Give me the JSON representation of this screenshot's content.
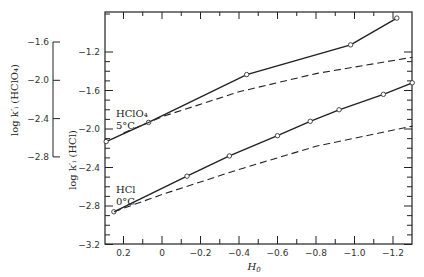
{
  "chart_data": {
    "type": "line",
    "title": "",
    "xlabel": "H0",
    "xlim": [
      0.3,
      -1.3
    ],
    "x_ticks": [
      0.2,
      0,
      -0.2,
      -0.4,
      -0.6,
      -0.8,
      -1.0,
      -1.2
    ],
    "x_tick_labels": [
      "0.2",
      "0",
      "−0.2",
      "−0.4",
      "−0.6",
      "−0.8",
      "−1.0",
      "−1.2"
    ],
    "y_axes": [
      {
        "id": "hcl",
        "label": "log k′ᵢ (HCl)",
        "position": "inner-left",
        "ylim": [
          -3.2,
          -0.8
        ],
        "ticks": [
          -1.2,
          -1.6,
          -2.0,
          -2.4,
          -2.8,
          -3.2
        ],
        "tick_labels": [
          "−1.2",
          "−1.6",
          "−2.0",
          "−2.4",
          "−2.8",
          "−3.2"
        ]
      },
      {
        "id": "hclo4",
        "label": "log k′ᵢ (HClO₄)",
        "position": "outer-left",
        "range": [
          -2.8,
          -1.6
        ],
        "ticks": [
          -1.6,
          -2.0,
          -2.4,
          -2.8
        ],
        "tick_labels": [
          "−1.6",
          "−2.0",
          "−2.4",
          "−2.8"
        ]
      }
    ],
    "series": [
      {
        "name": "HClO4 5°C (measured)",
        "axis": "hclo4",
        "style": "solid-with-open-circles",
        "x": [
          0.29,
          0.07,
          -0.44,
          -0.98,
          -1.22
        ],
        "y": [
          -2.64,
          -2.44,
          -1.94,
          -1.63,
          -1.35
        ],
        "note": "approximate; y read from outer-left HClO4 scale"
      },
      {
        "name": "HClO4 5°C (calculated)",
        "axis": "hclo4",
        "style": "dashed",
        "x": [
          0.2,
          0.0,
          -0.4,
          -0.8,
          -1.3
        ],
        "y": [
          -2.55,
          -2.38,
          -2.12,
          -1.93,
          -1.76
        ],
        "note": "approximate curve"
      },
      {
        "name": "HCl 0°C (measured)",
        "axis": "hcl",
        "style": "solid-with-open-circles",
        "x": [
          0.25,
          -0.13,
          -0.35,
          -0.6,
          -0.77,
          -0.92,
          -1.15,
          -1.3
        ],
        "y": [
          -2.86,
          -2.49,
          -2.28,
          -2.07,
          -1.92,
          -1.8,
          -1.64,
          -1.52
        ],
        "note": "approximate; y read from inner-left HCl scale"
      },
      {
        "name": "HCl 0°C (calculated)",
        "axis": "hcl",
        "style": "dashed",
        "x": [
          0.25,
          0.0,
          -0.4,
          -0.8,
          -1.3
        ],
        "y": [
          -2.86,
          -2.68,
          -2.42,
          -2.18,
          -1.97
        ],
        "note": "approximate curve"
      }
    ],
    "annotations": [
      {
        "text": "HClO₄",
        "sub": "5°C",
        "series": "HClO4"
      },
      {
        "text": "HCl",
        "sub": "0°C",
        "series": "HCl"
      }
    ],
    "grid": false,
    "legend": "none (inline labels)"
  },
  "labels": {
    "x_axis_title": "H",
    "x_axis_sub": "0",
    "hcl_axis_title": "log k′ᵢ (HCl)",
    "hclo4_axis_title": "log k′ᵢ (HClO₄)",
    "hclo4_label": "HClO₄",
    "hclo4_temp": "5°C",
    "hcl_label": "HCl",
    "hcl_temp": "0°C"
  }
}
